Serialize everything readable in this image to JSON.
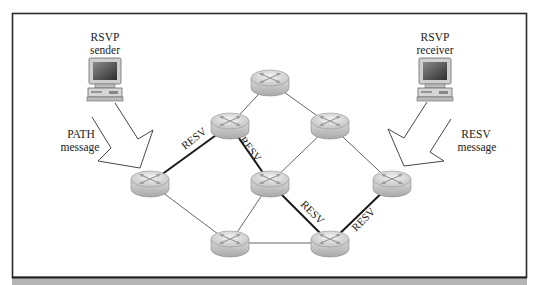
{
  "diagram": {
    "colors": {
      "frame": "#2a2a2a",
      "band": "#b4b4b4",
      "link": "#555555",
      "reserved_link": "#1a1a1a",
      "router_top": "#e6e6e6",
      "router_side": "#c8c8c8"
    },
    "hosts": [
      {
        "id": "sender",
        "label_line1": "RSVP",
        "label_line2": "sender",
        "x": 113,
        "y": 70
      },
      {
        "id": "receiver",
        "label_line1": "RSVP",
        "label_line2": "receiver",
        "x": 436,
        "y": 70
      }
    ],
    "arrows": [
      {
        "id": "path-arrow",
        "label_line1": "PATH",
        "label_line2": "message"
      },
      {
        "id": "resv-arrow",
        "label_line1": "RESV",
        "label_line2": "message"
      }
    ],
    "routers": [
      {
        "id": "r1",
        "x": 270,
        "y": 82
      },
      {
        "id": "r2",
        "x": 230,
        "y": 125
      },
      {
        "id": "r3",
        "x": 330,
        "y": 125
      },
      {
        "id": "r4",
        "x": 150,
        "y": 183
      },
      {
        "id": "r5",
        "x": 270,
        "y": 183
      },
      {
        "id": "r6",
        "x": 392,
        "y": 183
      },
      {
        "id": "r7",
        "x": 230,
        "y": 243
      },
      {
        "id": "r8",
        "x": 330,
        "y": 243
      }
    ],
    "links": [
      {
        "from": "r1",
        "to": "r2",
        "reserved": false
      },
      {
        "from": "r1",
        "to": "r3",
        "reserved": false
      },
      {
        "from": "r2",
        "to": "r4",
        "reserved": true,
        "label": "RESV"
      },
      {
        "from": "r2",
        "to": "r5",
        "reserved": true,
        "label": "RESV"
      },
      {
        "from": "r3",
        "to": "r5",
        "reserved": false
      },
      {
        "from": "r3",
        "to": "r6",
        "reserved": false
      },
      {
        "from": "r4",
        "to": "r7",
        "reserved": false
      },
      {
        "from": "r5",
        "to": "r7",
        "reserved": false
      },
      {
        "from": "r5",
        "to": "r8",
        "reserved": true,
        "label": "RESV"
      },
      {
        "from": "r6",
        "to": "r8",
        "reserved": true,
        "label": "RESV"
      },
      {
        "from": "r7",
        "to": "r8",
        "reserved": false
      }
    ],
    "resv_labels": [
      "RESV",
      "RESV",
      "RESV",
      "RESV"
    ]
  }
}
